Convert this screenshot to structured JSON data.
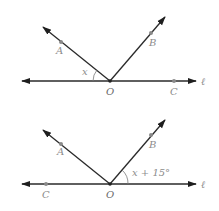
{
  "diagrams": [
    {
      "id": "top",
      "line_label": "ℓ",
      "vertex_label": "O",
      "points": {
        "A": "A",
        "B": "B",
        "C": "C"
      },
      "angle_label": "x",
      "angle_between": [
        "ray OA",
        "line ℓ (left side)"
      ]
    },
    {
      "id": "bottom",
      "line_label": "ℓ",
      "vertex_label": "O",
      "points": {
        "A": "A",
        "B": "B",
        "C": "C"
      },
      "angle_label": "x + 15°",
      "angle_between": [
        "ray OB",
        "line ℓ (right side)"
      ]
    }
  ],
  "colors": {
    "line": "#2a2a2a",
    "label": "#8c8c8c",
    "point": "#8a8a8a"
  }
}
